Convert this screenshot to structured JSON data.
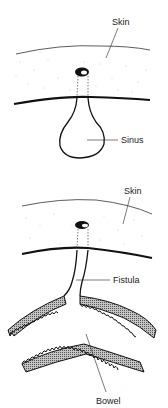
{
  "diagram": {
    "panels": [
      {
        "name": "sinus",
        "labels": {
          "skin": "Skin",
          "structure": "Sinus"
        }
      },
      {
        "name": "fistula",
        "labels": {
          "skin": "Skin",
          "structure": "Fistula",
          "bowel": "Bowel"
        }
      }
    ]
  },
  "colors": {
    "line": "#111111",
    "hatch_fill": "#9a9a9a",
    "stipple": "#c8c8c8",
    "background": "#ffffff"
  }
}
